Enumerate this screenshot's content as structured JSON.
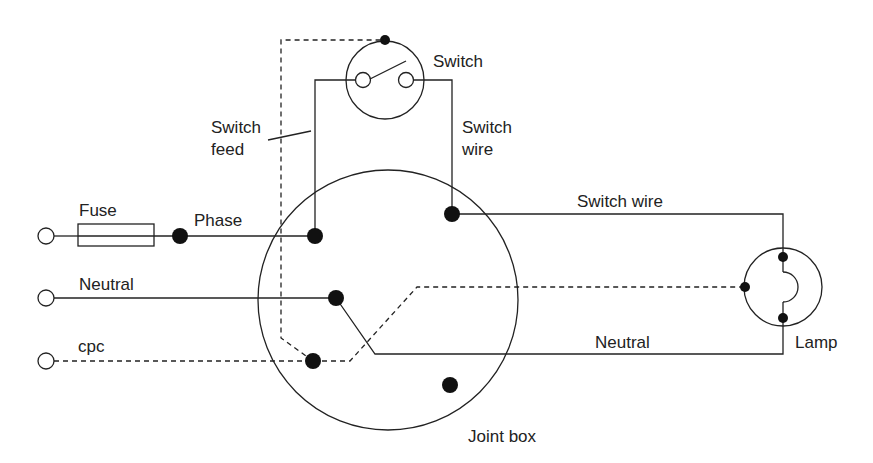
{
  "diagram": {
    "labels": {
      "switch": "Switch",
      "switch_feed_line1": "Switch",
      "switch_feed_line2": "feed",
      "switch_wire_line1": "Switch",
      "switch_wire_line2": "wire",
      "switch_wire_horizontal": "Switch wire",
      "fuse": "Fuse",
      "phase": "Phase",
      "neutral_supply": "Neutral",
      "cpc": "cpc",
      "neutral_lamp": "Neutral",
      "lamp": "Lamp",
      "joint_box": "Joint box"
    },
    "components": [
      {
        "name": "Supply phase terminal",
        "type": "hollow-terminal"
      },
      {
        "name": "Supply neutral terminal",
        "type": "hollow-terminal"
      },
      {
        "name": "Supply cpc terminal",
        "type": "hollow-terminal"
      },
      {
        "name": "Fuse",
        "type": "fuse"
      },
      {
        "name": "Switch",
        "type": "single-pole switch"
      },
      {
        "name": "Joint box",
        "type": "junction box",
        "terminals": 5
      },
      {
        "name": "Lamp",
        "type": "lampholder"
      }
    ],
    "connections": [
      {
        "from": "Supply phase",
        "to": "Joint box terminal 1",
        "via": "Fuse",
        "label": "Phase",
        "style": "solid"
      },
      {
        "from": "Joint box terminal 1",
        "to": "Switch",
        "label": "Switch feed",
        "style": "solid"
      },
      {
        "from": "Switch",
        "to": "Joint box terminal 2",
        "label": "Switch wire",
        "style": "solid"
      },
      {
        "from": "Joint box terminal 2",
        "to": "Lamp",
        "label": "Switch wire",
        "style": "solid"
      },
      {
        "from": "Supply neutral",
        "to": "Joint box terminal 3",
        "label": "Neutral",
        "style": "solid"
      },
      {
        "from": "Joint box terminal 3",
        "to": "Lamp",
        "label": "Neutral",
        "style": "solid"
      },
      {
        "from": "Supply cpc",
        "to": "Joint box terminal 4",
        "label": "cpc",
        "style": "dashed"
      },
      {
        "from": "Joint box terminal 4",
        "to": "Switch",
        "label": "cpc",
        "style": "dashed"
      },
      {
        "from": "Joint box terminal 4",
        "to": "Lamp",
        "label": "cpc",
        "style": "dashed"
      }
    ]
  }
}
